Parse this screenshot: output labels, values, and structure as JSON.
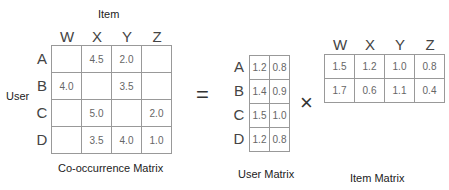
{
  "cooccurrence": {
    "title": "Co-occurrence Matrix",
    "column_axis_label": "Item",
    "row_axis_label": "User",
    "columns": [
      "W",
      "X",
      "Y",
      "Z"
    ],
    "rows": [
      "A",
      "B",
      "C",
      "D"
    ],
    "cells": [
      [
        "",
        "4.5",
        "2.0",
        ""
      ],
      [
        "4.0",
        "",
        "3.5",
        ""
      ],
      [
        "",
        "5.0",
        "",
        "2.0"
      ],
      [
        "",
        "3.5",
        "4.0",
        "1.0"
      ]
    ]
  },
  "equals_symbol": "=",
  "times_symbol": "×",
  "user_matrix": {
    "title": "User Matrix",
    "rows": [
      "A",
      "B",
      "C",
      "D"
    ],
    "cells": [
      [
        "1.2",
        "0.8"
      ],
      [
        "1.4",
        "0.9"
      ],
      [
        "1.5",
        "1.0"
      ],
      [
        "1.2",
        "0.8"
      ]
    ]
  },
  "item_matrix": {
    "title": "Item Matrix",
    "columns": [
      "W",
      "X",
      "Y",
      "Z"
    ],
    "cells": [
      [
        "1.5",
        "1.2",
        "1.0",
        "0.8"
      ],
      [
        "1.7",
        "0.6",
        "1.1",
        "0.4"
      ]
    ]
  }
}
